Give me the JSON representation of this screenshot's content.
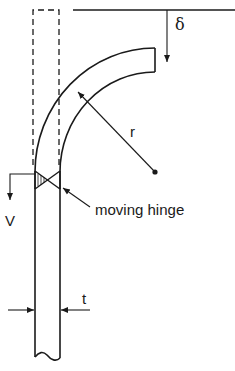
{
  "diagram": {
    "type": "mechanics-schematic",
    "labels": {
      "delta": "δ",
      "radius": "r",
      "velocity": "V",
      "hinge": "moving hinge",
      "thickness": "t"
    },
    "colors": {
      "stroke": "#1a1a1a",
      "background": "#ffffff"
    },
    "elements": [
      {
        "name": "original-position-outline",
        "style": "dashed"
      },
      {
        "name": "reference-line",
        "style": "solid"
      },
      {
        "name": "deflection-arrow",
        "label": "δ"
      },
      {
        "name": "curved-bar",
        "style": "solid"
      },
      {
        "name": "radius-arrow",
        "label": "r"
      },
      {
        "name": "center-point"
      },
      {
        "name": "moving-hinge",
        "label": "moving hinge"
      },
      {
        "name": "velocity-arrow",
        "label": "V"
      },
      {
        "name": "straight-bar"
      },
      {
        "name": "thickness-arrows",
        "label": "t"
      }
    ]
  }
}
